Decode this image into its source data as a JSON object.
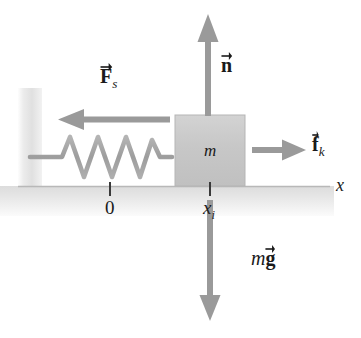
{
  "figure": {
    "type": "free-body-diagram",
    "background_color": "#ffffff"
  },
  "colors": {
    "wall": "#e4e4e4",
    "ground": "#e2e2e2",
    "block": "#c9c9c9",
    "block_edge": "#b3b3b3",
    "arrow": "#9a9a9a",
    "spring": "#a3a3a3",
    "text": "#1a1a1a",
    "tick": "#3a3a3a",
    "ground_line": "#b8b8b8"
  },
  "objects": {
    "block": {
      "mass_label": "m",
      "center_x": 210,
      "top_y": 115,
      "bottom_y": 185
    },
    "wall": {
      "x": 18,
      "top_y": 88,
      "bottom_y": 200
    },
    "spring": {
      "coil_count": 5,
      "left_x": 30,
      "right_x": 172,
      "axis_y": 157
    },
    "ground": {
      "surface_y": 186,
      "left_x": 18,
      "right_x": 330
    }
  },
  "forces": [
    {
      "id": "spring-force",
      "symbol": "F",
      "subscript": "s",
      "label_text": "F_s",
      "direction": "left",
      "tail_x": 170,
      "tip_x": 58,
      "y": 120,
      "label_x": 100,
      "label_y": 66
    },
    {
      "id": "normal-force",
      "symbol": "n",
      "subscript": "",
      "label_text": "n",
      "direction": "up",
      "tail_y": 116,
      "tip_y": 14,
      "x": 208,
      "label_x": 221,
      "label_y": 55
    },
    {
      "id": "kinetic-friction",
      "symbol": "f",
      "subscript": "k",
      "label_text": "f_k",
      "direction": "right",
      "tail_x": 252,
      "tip_x": 306,
      "y": 150,
      "label_x": 312,
      "label_y": 134
    },
    {
      "id": "weight",
      "symbol": "g",
      "prefix": "m",
      "subscript": "",
      "label_text": "mg",
      "direction": "down",
      "tail_y": 200,
      "tip_y": 321,
      "x": 210,
      "label_x": 251,
      "label_y": 248
    }
  ],
  "axis": {
    "name": "x",
    "label_x": 336,
    "label_y": 176,
    "markers": [
      {
        "id": "origin",
        "label": "0",
        "x": 110,
        "tick_top_y": 182,
        "tick_bottom_y": 196,
        "label_y": 198
      },
      {
        "id": "initial-position",
        "label": "x_i",
        "symbol": "x",
        "subscript": "i",
        "x": 210,
        "tick_top_y": 182,
        "tick_bottom_y": 196,
        "label_y": 198
      }
    ]
  }
}
